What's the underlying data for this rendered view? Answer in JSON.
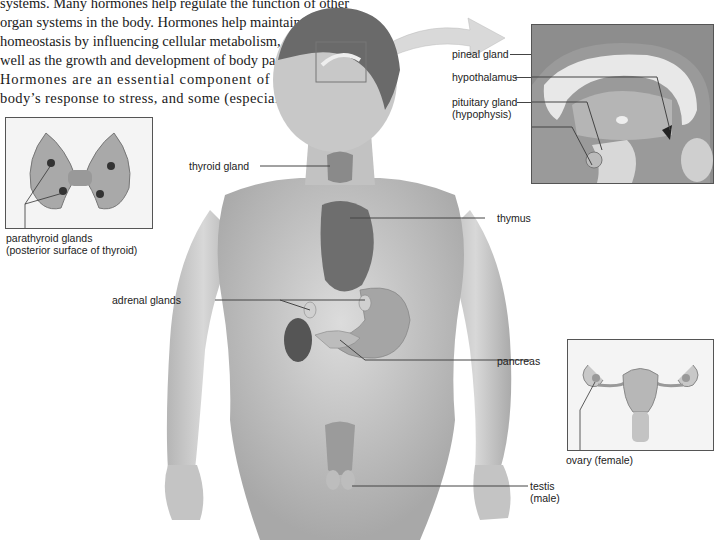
{
  "body_text": {
    "lines": [
      "systems. Many hormones help regulate the function of other",
      "organ systems in the body. Hormones help maintain",
      "homeostasis by influencing cellular metabolism, as",
      "well as the growth and development of body parts.",
      "Hormones are an essential component of the",
      "body’s response to stress, and some (especially"
    ]
  },
  "figure": {
    "labels": {
      "pineal": "pineal gland",
      "hypothalamus": "hypothalamus",
      "pituitary_1": "pituitary gland",
      "pituitary_2": "(hypophysis)",
      "thyroid": "thyroid gland",
      "thymus": "thymus",
      "parathyroid_1": "parathyroid glands",
      "parathyroid_2": "(posterior surface of thyroid)",
      "adrenal": "adrenal glands",
      "pancreas": "pancreas",
      "ovary": "ovary (female)",
      "testis_1": "testis",
      "testis_2": "(male)"
    },
    "colors": {
      "skin": "#c9c9c9",
      "organ_dark": "#5a5a5a",
      "inset_border": "#555555",
      "leader_line": "#444444"
    }
  }
}
